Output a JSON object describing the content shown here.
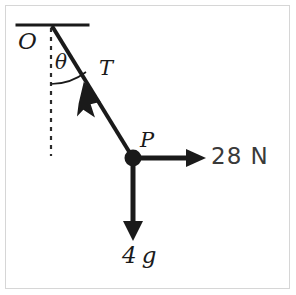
{
  "figure": {
    "background_color": "#ffffff",
    "frame_color": "#d6d6d6",
    "ink_color": "#1a1a1a"
  },
  "labels": {
    "pivot": "O",
    "angle": "θ",
    "tension": "T",
    "particle": "P",
    "horizontal_force": "28 N",
    "weight": "4g",
    "weight_number": "4",
    "weight_symbol": "g"
  },
  "elements": {
    "ceiling": {
      "name": "ceiling-line",
      "x1": 17,
      "y1": 25,
      "x2": 88,
      "y2": 25,
      "stroke_width": 3
    },
    "string": {
      "name": "string-line",
      "x1": 52,
      "y1": 26,
      "x2": 133,
      "y2": 158,
      "stroke_width": 4
    },
    "vertical_dashed": {
      "name": "vertical-dashed-line",
      "x1": 51,
      "y1": 27,
      "x2": 51,
      "y2": 156,
      "stroke_width": 2,
      "dash": "4 5"
    },
    "angle_arc": {
      "name": "angle-arc",
      "center_x": 51,
      "center_y": 27,
      "radius": 57,
      "stroke_width": 1.5
    },
    "tension_arrow": {
      "name": "tension-arrow",
      "from_x": 110,
      "from_y": 125,
      "to_x": 84,
      "to_y": 83,
      "stroke_width": 4
    },
    "particle_dot": {
      "name": "particle-dot",
      "cx": 133,
      "cy": 158,
      "r": 8
    },
    "horizontal_arrow": {
      "name": "horizontal-force-arrow",
      "from_x": 133,
      "from_y": 158,
      "to_x": 205,
      "to_y": 158,
      "stroke_width": 5
    },
    "vertical_arrow": {
      "name": "weight-arrow",
      "from_x": 133,
      "from_y": 158,
      "to_x": 133,
      "to_y": 240,
      "stroke_width": 5
    }
  }
}
